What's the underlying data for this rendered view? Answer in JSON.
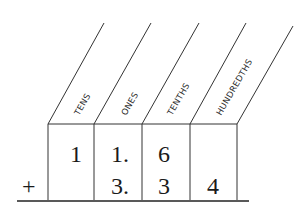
{
  "diagram": {
    "columns": [
      {
        "label": "TENS"
      },
      {
        "label": "ONES"
      },
      {
        "label": "TENTHS"
      },
      {
        "label": "HUNDREDTHS"
      }
    ],
    "operator": "+",
    "rows": [
      {
        "cells": [
          "1",
          "1.",
          "6",
          ""
        ]
      },
      {
        "cells": [
          "",
          "3.",
          "3",
          "4"
        ]
      }
    ]
  }
}
